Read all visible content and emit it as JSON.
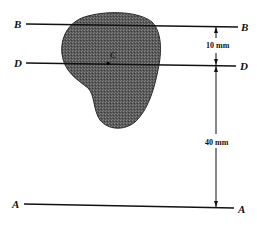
{
  "diagram": {
    "type": "centroid-parallel-axes",
    "colors": {
      "shape_fill": "#5a5a5a",
      "line": "#111111",
      "background": "#ffffff"
    },
    "axes": [
      {
        "name": "B",
        "left_label": "B",
        "right_label": "B"
      },
      {
        "name": "D",
        "left_label": "D",
        "right_label": "D"
      },
      {
        "name": "A",
        "left_label": "A",
        "right_label": "A"
      }
    ],
    "centroid_label": "C",
    "dimensions": [
      {
        "between": [
          "B",
          "D"
        ],
        "label": "10 mm"
      },
      {
        "between": [
          "D",
          "A"
        ],
        "label": "40 mm"
      }
    ]
  }
}
